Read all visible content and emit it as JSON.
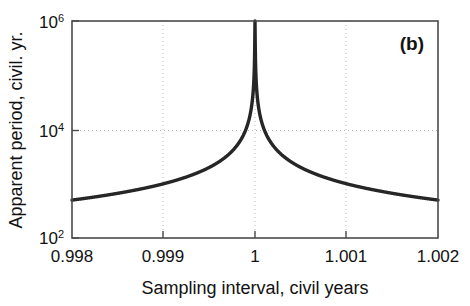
{
  "figure": {
    "panel_label": "(b)",
    "background_color": "#ffffff",
    "frame_color": "#4a4a4a",
    "curve_color": "#262626",
    "grid_color": "#b9b9b9"
  },
  "axes": {
    "x": {
      "title": "Sampling interval, civil years",
      "ticks": [
        "0.998",
        "0.999",
        "1",
        "1.001",
        "1.002"
      ],
      "tick_values": [
        0.998,
        0.999,
        1,
        1.001,
        1.002
      ],
      "range": [
        0.998,
        1.002
      ]
    },
    "y": {
      "title": "Apparent period, civil. yr.",
      "ticks": [
        {
          "mantissa": "10",
          "exponent": "2"
        },
        {
          "mantissa": "10",
          "exponent": "4"
        },
        {
          "mantissa": "10",
          "exponent": "6"
        }
      ],
      "tick_values": [
        100,
        10000,
        1000000
      ],
      "range": [
        100,
        1000000
      ],
      "scale": "log"
    }
  },
  "chart_data": {
    "type": "line",
    "title": "",
    "subtitle": "",
    "xlabel": "Sampling interval, civil years",
    "ylabel": "Apparent period, civil. yr.",
    "xlim": [
      0.998,
      1.002
    ],
    "ylim": [
      100,
      1000000
    ],
    "yscale": "log",
    "xscale": "linear",
    "grid": true,
    "grid_style": "dotted",
    "legend": "none",
    "annotations": [
      {
        "text": "(b)",
        "position": "top-right"
      }
    ],
    "series": [
      {
        "name": "Apparent period",
        "relation": "T = 1 / |s - 1|",
        "x": [
          0.998,
          0.9982,
          0.9984,
          0.9986,
          0.9988,
          0.999,
          0.9992,
          0.9994,
          0.9995,
          0.9996,
          0.9997,
          0.9998,
          0.99985,
          0.9999,
          0.99995,
          0.99999,
          1.0,
          1.00001,
          1.00005,
          1.0001,
          1.00015,
          1.0002,
          1.0003,
          1.0004,
          1.0005,
          1.0006,
          1.0008,
          1.001,
          1.0012,
          1.0014,
          1.0016,
          1.0018,
          1.002
        ],
        "y": [
          500,
          556,
          625,
          714,
          833,
          1000,
          1250,
          1667,
          2000,
          2500,
          3333,
          5000,
          6667,
          10000,
          20000,
          100000,
          1000000,
          100000,
          20000,
          10000,
          6667,
          5000,
          3333,
          2500,
          2000,
          1667,
          1250,
          1000,
          833,
          714,
          625,
          556,
          500
        ]
      }
    ]
  }
}
